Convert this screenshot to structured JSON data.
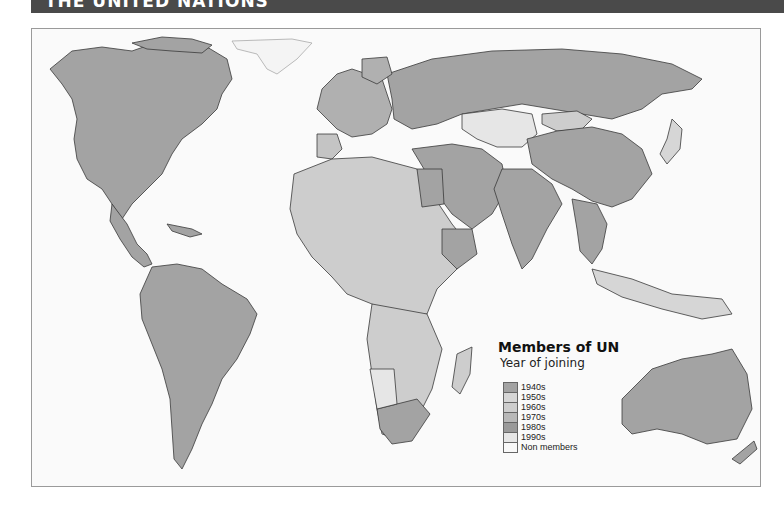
{
  "header": {
    "title": "THE UNITED NATIONS"
  },
  "legend": {
    "title": "Members of UN",
    "subtitle": "Year of joining",
    "items": [
      {
        "label": "1940s",
        "color": "#a3a3a3"
      },
      {
        "label": "1950s",
        "color": "#d6d6d6"
      },
      {
        "label": "1960s",
        "color": "#cdcdcd"
      },
      {
        "label": "1970s",
        "color": "#b8b8b8"
      },
      {
        "label": "1980s",
        "color": "#9a9a9a"
      },
      {
        "label": "1990s",
        "color": "#e6e6e6"
      },
      {
        "label": "Non members",
        "color": "#f8f8f8"
      }
    ]
  },
  "colors": {
    "header_bg": "#4a4a4a",
    "ocean": "#fafafa",
    "border_line": "#333333",
    "frame": "#9a9a9a"
  }
}
